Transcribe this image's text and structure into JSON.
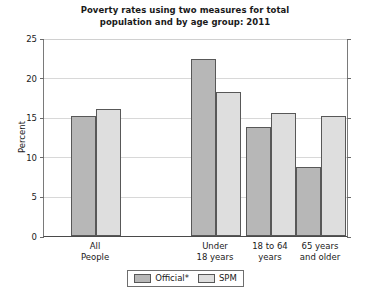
{
  "chart_data": {
    "type": "bar",
    "title": "Poverty rates using two measures for total population and by age group: 2011",
    "title_line1": "Poverty rates using two measures for total",
    "title_line2": "population and by age group: 2011",
    "xlabel": "",
    "ylabel": "Percent",
    "ylim": [
      0,
      25
    ],
    "yticks": [
      0,
      5,
      10,
      15,
      20,
      25
    ],
    "ytick_labels": [
      "0",
      "5",
      "10",
      "15",
      "20",
      "25"
    ],
    "grid": true,
    "legend_position": "bottom",
    "categories": [
      "All People",
      "Under 18 years",
      "18 to 64 years",
      "65 years and older"
    ],
    "category_lines": [
      [
        "All",
        "People"
      ],
      [
        "Under",
        "18 years"
      ],
      [
        "18 to 64",
        "years"
      ],
      [
        "65 years",
        "and older"
      ]
    ],
    "series": [
      {
        "name": "Official*",
        "color": "#b7b7b7",
        "values": [
          15.1,
          22.3,
          13.8,
          8.7
        ]
      },
      {
        "name": "SPM",
        "color": "#dedede",
        "values": [
          16.1,
          18.2,
          15.5,
          15.2
        ]
      }
    ]
  },
  "legend": {
    "items": [
      {
        "label": "Official*"
      },
      {
        "label": "SPM"
      }
    ]
  },
  "footnote": {
    "text": ""
  }
}
